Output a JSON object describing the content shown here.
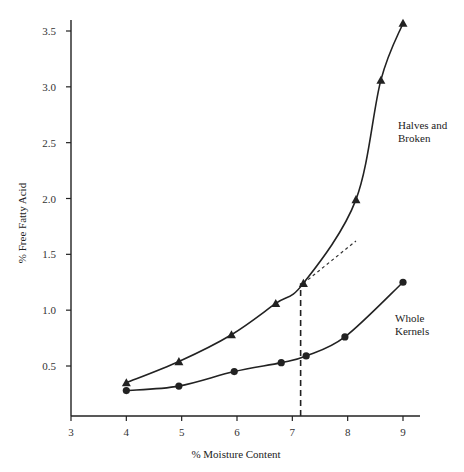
{
  "chart_data": {
    "type": "line",
    "title": "",
    "xlabel": "% Moisture Content",
    "ylabel": "% Free Fatty Acid",
    "xlim": [
      3,
      9
    ],
    "ylim": [
      0.15,
      3.55
    ],
    "xticks": [
      3,
      4,
      5,
      6,
      7,
      8,
      9
    ],
    "xtick_labels": [
      "3",
      "4",
      "5",
      "6",
      "7",
      "8",
      "9"
    ],
    "yticks": [
      0.5,
      1.0,
      1.5,
      2.0,
      2.5,
      3.0,
      3.5
    ],
    "ytick_labels": [
      "0.5",
      "1.0",
      "1.5",
      "2.0",
      "2.5",
      "3.0",
      "3.5"
    ],
    "grid": false,
    "legend": "inline labels",
    "series": [
      {
        "name": "Halves and Broken",
        "marker": "triangle",
        "x": [
          4.0,
          4.95,
          5.9,
          6.7,
          7.2,
          8.15,
          8.6,
          9.0
        ],
        "y": [
          0.35,
          0.54,
          0.78,
          1.06,
          1.24,
          1.99,
          3.06,
          3.57
        ]
      },
      {
        "name": "Whole Kernels",
        "marker": "circle",
        "x": [
          4.0,
          4.95,
          5.95,
          6.8,
          7.25,
          7.95,
          9.0
        ],
        "y": [
          0.28,
          0.32,
          0.45,
          0.53,
          0.59,
          0.76,
          1.25
        ]
      }
    ],
    "annotations": [
      {
        "type": "dashed-vertical-line",
        "x": 7.15,
        "y_from": 0.15,
        "y_to": 1.24
      },
      {
        "type": "dotted-extension",
        "from": [
          7.2,
          1.24
        ],
        "to": [
          8.15,
          1.62
        ]
      }
    ],
    "labels": {
      "halves_line1": "Halves and",
      "halves_line2": "Broken",
      "whole_line1": "Whole",
      "whole_line2": "Kernels"
    }
  }
}
